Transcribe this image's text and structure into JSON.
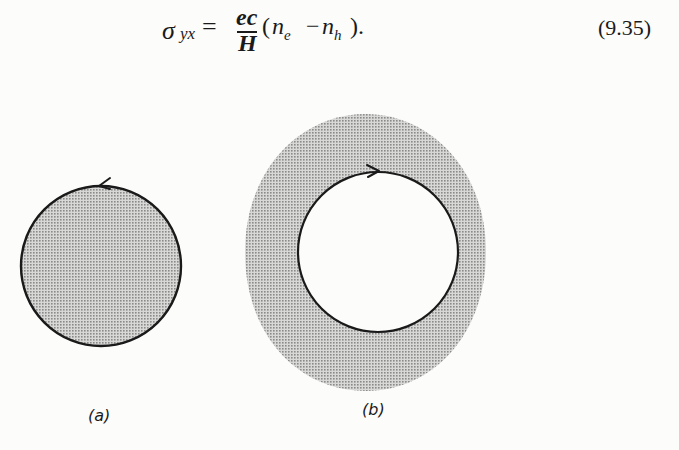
{
  "equation": {
    "lhs_symbol": "σ",
    "lhs_subscript": "yx",
    "equals": "=",
    "numerator": "ec",
    "denominator": "H",
    "paren_open": "(",
    "n1": "n",
    "n1_sub": "e",
    "minus": "−",
    "n2": "n",
    "n2_sub": "h",
    "paren_close": ").",
    "number": "(9.35)"
  },
  "figure": {
    "panels": [
      {
        "label": "(a)",
        "description": "Shaded disk bounded by a circular orbit",
        "orbit_direction": "counterclockwise",
        "shaded_region": "inside"
      },
      {
        "label": "(b)",
        "description": "Shaded annulus with a white interior bounded by a circular orbit",
        "orbit_direction": "clockwise",
        "shaded_region": "outside"
      }
    ],
    "colors": {
      "ink": "#1a1a1a",
      "shade": "#c4c4c4",
      "background": "#fcfcfa"
    }
  }
}
